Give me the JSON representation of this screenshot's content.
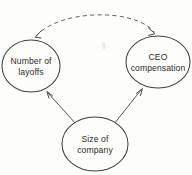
{
  "diagram": {
    "background_color": "#fdfdfc",
    "line_color": "#4a4a4a",
    "text_color": "#2b2b2b",
    "nodes": [
      {
        "id": "layoffs",
        "label_line1": "Number of",
        "label_line2": "layoffs",
        "shape": "ellipse",
        "cx": 31,
        "cy": 66,
        "rx": 29,
        "ry": 26
      },
      {
        "id": "ceo_compensation",
        "label_line1": "CEO",
        "label_line2": "compensation",
        "shape": "ellipse",
        "cx": 158,
        "cy": 62,
        "rx": 32,
        "ry": 26
      },
      {
        "id": "company_size",
        "label_line1": "Size of",
        "label_line2": "company",
        "shape": "ellipse",
        "cx": 95,
        "cy": 144,
        "rx": 33,
        "ry": 27
      }
    ],
    "edges": [
      {
        "id": "layoffs-ceo-correlation",
        "from": "layoffs",
        "to": "ceo_compensation",
        "style": "dashed",
        "direction": "bidirectional",
        "label": ""
      },
      {
        "id": "size-to-layoffs",
        "from": "company_size",
        "to": "layoffs",
        "style": "solid",
        "direction": "unidirectional",
        "label": ""
      },
      {
        "id": "size-to-ceo",
        "from": "company_size",
        "to": "ceo_compensation",
        "style": "solid",
        "direction": "unidirectional",
        "label": ""
      }
    ]
  }
}
